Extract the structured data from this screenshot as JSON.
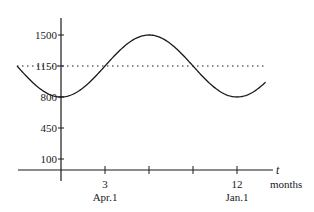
{
  "chart_data": {
    "type": "line",
    "title": "",
    "xlabel": "t",
    "xunit": "months",
    "ylabel": "",
    "xlim": [
      -3,
      14
    ],
    "ylim": [
      0,
      1650
    ],
    "grid": false,
    "legend": null,
    "x_ticks": [
      {
        "value": 3,
        "label": "3",
        "sublabel": "Apr.1"
      },
      {
        "value": 6,
        "label": "",
        "sublabel": ""
      },
      {
        "value": 9,
        "label": "",
        "sublabel": ""
      },
      {
        "value": 12,
        "label": "12",
        "sublabel": "Jan.1"
      }
    ],
    "y_ticks": [
      {
        "value": 1500,
        "label": "1500"
      },
      {
        "value": 1150,
        "label": "1150"
      },
      {
        "value": 800,
        "label": "800"
      },
      {
        "value": 450,
        "label": "450"
      },
      {
        "value": 100,
        "label": "100"
      }
    ],
    "series": [
      {
        "name": "sinusoid",
        "style": "solid",
        "formula": "1150 - 350*cos(2*pi*t/12)",
        "x": [
          -3,
          -2,
          -1,
          0,
          1,
          2,
          3,
          4,
          5,
          6,
          7,
          8,
          9,
          10,
          11,
          12,
          13,
          14
        ],
        "values": [
          1150,
          975,
          847,
          800,
          847,
          975,
          1150,
          1325,
          1453,
          1500,
          1453,
          1325,
          1150,
          975,
          847,
          800,
          847,
          975
        ]
      },
      {
        "name": "midline",
        "style": "dotted",
        "x": [
          -3,
          14
        ],
        "values": [
          1150,
          1150
        ]
      }
    ],
    "annotations": {
      "max_value": 1500,
      "min_value": 800,
      "midline": 1150,
      "period_months": 12
    }
  },
  "labels": {
    "x_axis_var": "t",
    "x_axis_unit": "months",
    "tick_3": "3",
    "tick_3_sub": "Apr.1",
    "tick_12": "12",
    "tick_12_sub": "Jan.1",
    "y_1500": "1500",
    "y_1150": "1150",
    "y_800": "800",
    "y_450": "450",
    "y_100": "100"
  }
}
